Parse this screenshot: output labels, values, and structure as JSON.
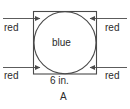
{
  "figure": {
    "name": "A",
    "figure_label": "A",
    "square": {
      "side_label": "6 in.",
      "side_length": 6,
      "units": "in.",
      "stroke": "#4a4a4a"
    },
    "circle": {
      "region_label": "blue",
      "inscribed": true,
      "stroke": "#4a4a4a"
    },
    "corner_regions": {
      "label": "red",
      "count": 4,
      "labels": {
        "top_left": "red",
        "top_right": "red",
        "bottom_left": "red",
        "bottom_right": "red"
      }
    },
    "leader_lines": {
      "arrow_head": "arrow-head",
      "stroke": "#4a4a4a"
    }
  }
}
